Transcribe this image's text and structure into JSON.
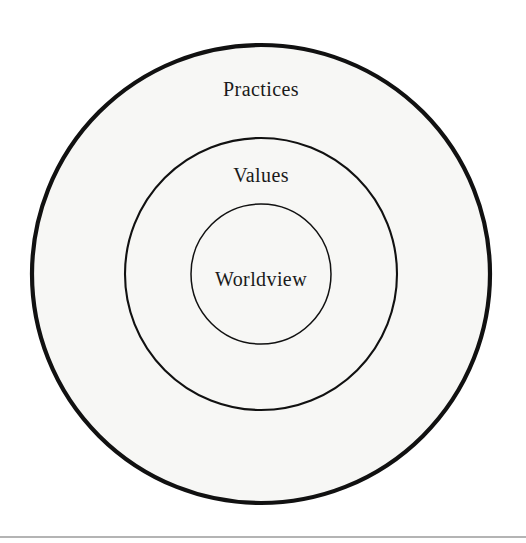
{
  "figure": {
    "type": "concentric-circles-nested-diagram",
    "background_color": "#ffffff",
    "ring_fill_color": "#f7f7f5",
    "stroke_color": "#111111",
    "text_color": "#1a1a1a",
    "rule_color": "#6b6b6b",
    "center": {
      "x": 261,
      "y": 274
    },
    "rings": [
      {
        "id": "outer",
        "label": "Practices",
        "radius": 229,
        "stroke_width": 4.2,
        "label_x": 261,
        "label_y": 91,
        "label_class": "label-practices"
      },
      {
        "id": "middle",
        "label": "Values",
        "radius": 136,
        "stroke_width": 2.1,
        "label_x": 261,
        "label_y": 177,
        "label_class": "label-values"
      },
      {
        "id": "inner",
        "label": "Worldview",
        "radius": 70,
        "stroke_width": 1.5,
        "label_x": 261,
        "label_y": 281,
        "label_class": "label-worldview"
      }
    ],
    "bottom_rule": {
      "x1": 0,
      "y1": 537,
      "x2": 526,
      "y2": 537
    }
  }
}
